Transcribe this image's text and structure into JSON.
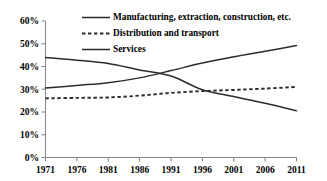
{
  "chart_data": {
    "type": "line",
    "title": "",
    "subtitle": "",
    "xlabel": "",
    "ylabel": "",
    "xlim": [
      1971,
      2011
    ],
    "ylim": [
      0,
      60
    ],
    "grid": false,
    "legend_position": "top-center",
    "y_ticks": [
      "0%",
      "10%",
      "20%",
      "30%",
      "40%",
      "50%",
      "60%"
    ],
    "y_tick_values": [
      0,
      10,
      20,
      30,
      40,
      50,
      60
    ],
    "x_ticks": [
      "1971",
      "1976",
      "1981",
      "1986",
      "1991",
      "1996",
      "2001",
      "2006",
      "2011"
    ],
    "x_tick_values": [
      1971,
      1976,
      1981,
      1986,
      1991,
      1996,
      2001,
      2006,
      2011
    ],
    "x": [
      1971,
      1976,
      1981,
      1986,
      1991,
      1996,
      2001,
      2006,
      2011
    ],
    "series": [
      {
        "name": "Manufacturing, extraction, construction, etc.",
        "style": "solid",
        "color": "#2b2b2b",
        "values": [
          44.0,
          42.8,
          41.3,
          38.5,
          35.8,
          29.8,
          26.8,
          23.8,
          20.5
        ]
      },
      {
        "name": "Distribution and transport",
        "style": "dashed",
        "color": "#2b2b2b",
        "values": [
          26.0,
          26.2,
          26.4,
          27.2,
          28.4,
          29.2,
          29.7,
          30.3,
          31.0
        ]
      },
      {
        "name": "Services",
        "style": "solid",
        "color": "#2b2b2b",
        "values": [
          30.5,
          31.7,
          32.9,
          35.0,
          38.2,
          41.5,
          44.3,
          46.7,
          49.2
        ]
      }
    ],
    "annotations": []
  },
  "legend": {
    "entries": [
      {
        "label": "Manufacturing, extraction, construction, etc."
      },
      {
        "label": "Distribution and transport"
      },
      {
        "label": "Services"
      }
    ]
  },
  "colors": {
    "axis": "#8a8a8a",
    "line": "#2b2b2b",
    "background": "#ffffff",
    "text": "#000000"
  }
}
